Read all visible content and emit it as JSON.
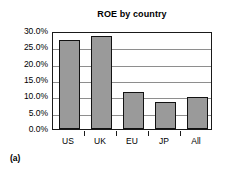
{
  "caption": "(a)",
  "chart_data": {
    "type": "bar",
    "title": "ROE by country",
    "xlabel": "",
    "ylabel": "",
    "categories": [
      "US",
      "UK",
      "EU",
      "JP",
      "All"
    ],
    "values": [
      27.2,
      28.5,
      11.3,
      8.3,
      9.8
    ],
    "ylim": [
      0,
      30
    ],
    "ytick_values": [
      0,
      5,
      10,
      15,
      20,
      25,
      30
    ],
    "ytick_labels": [
      "0.0%",
      "5.0%",
      "10.0%",
      "15.0%",
      "20.0%",
      "25.0%",
      "30.0%"
    ],
    "grid": true,
    "legend": false,
    "bar_color": "#9a9a9a",
    "bar_border_color": "#121212",
    "gridline_color": "#8e8e8e",
    "axis_color": "#1a1a1a"
  }
}
